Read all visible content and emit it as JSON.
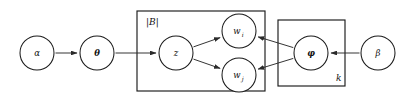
{
  "figure": {
    "type": "probabilistic-graphical-model-plate-diagram",
    "background_color": "#ffffff",
    "stroke_color": "#1a1a1a",
    "width": 408,
    "height": 102
  },
  "nodes": [
    {
      "id": "alpha",
      "label": "α",
      "bold": false,
      "cx": 37,
      "cy": 53,
      "r": 17
    },
    {
      "id": "theta",
      "label": "θ",
      "bold": true,
      "cx": 97,
      "cy": 53,
      "r": 17
    },
    {
      "id": "z",
      "label": "z",
      "bold": false,
      "cx": 176,
      "cy": 53,
      "r": 17
    },
    {
      "id": "w_i",
      "label": "w",
      "sub": "i",
      "bold": false,
      "cx": 239,
      "cy": 31,
      "r": 17
    },
    {
      "id": "w_j",
      "label": "w",
      "sub": "j",
      "bold": false,
      "cx": 239,
      "cy": 75,
      "r": 17
    },
    {
      "id": "phi",
      "label": "φ",
      "bold": true,
      "cx": 311,
      "cy": 53,
      "r": 17
    },
    {
      "id": "beta",
      "label": "β",
      "bold": false,
      "cx": 378,
      "cy": 53,
      "r": 17
    }
  ],
  "plates": [
    {
      "id": "plate-B",
      "label": "|B|",
      "label_x": 146,
      "label_y": 22,
      "x": 137,
      "y": 11,
      "w": 128,
      "h": 80
    },
    {
      "id": "plate-k",
      "label": "k",
      "label_x": 336,
      "label_y": 78,
      "x": 278,
      "y": 20,
      "w": 67,
      "h": 66
    }
  ],
  "edges": [
    {
      "id": "alpha-to-theta",
      "from": "alpha",
      "to": "theta",
      "arrow": true
    },
    {
      "id": "theta-to-z",
      "from": "theta",
      "to": "z",
      "arrow": true
    },
    {
      "id": "z-to-w_i",
      "from": "z",
      "to": "w_i",
      "arrow": true
    },
    {
      "id": "z-to-w_j",
      "from": "z",
      "to": "w_j",
      "arrow": true
    },
    {
      "id": "phi-to-w_i",
      "from": "phi",
      "to": "w_i",
      "arrow": true
    },
    {
      "id": "phi-to-w_j",
      "from": "phi",
      "to": "w_j",
      "arrow": true
    },
    {
      "id": "beta-to-phi",
      "from": "beta",
      "to": "phi",
      "arrow": true
    }
  ]
}
